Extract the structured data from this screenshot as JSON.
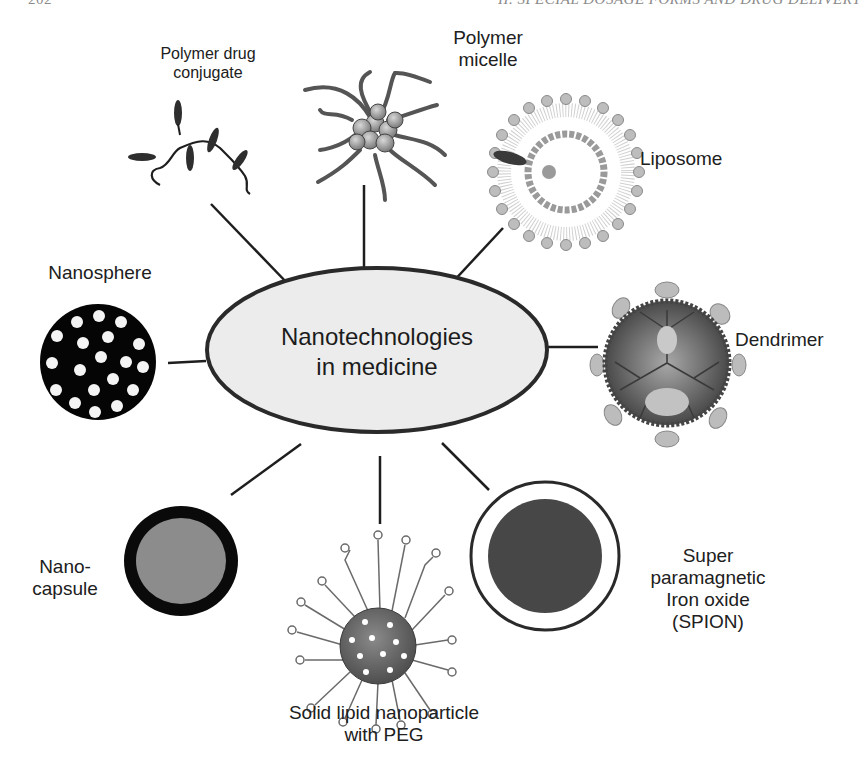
{
  "page": {
    "page_number": "202",
    "running_head": "II. SPECIAL DOSAGE FORMS AND DRUG DELIVERY"
  },
  "diagram": {
    "center": {
      "line1": "Nanotechnologies",
      "line2": "in medicine"
    },
    "nodes": [
      {
        "id": "polymer-drug-conjugate",
        "line1": "Polymer drug",
        "line2": "conjugate",
        "icon": "polymer-drug-conjugate-icon"
      },
      {
        "id": "polymer-micelle",
        "line1": "Polymer",
        "line2": "micelle",
        "icon": "polymer-micelle-icon"
      },
      {
        "id": "liposome",
        "line1": "Liposome",
        "icon": "liposome-icon"
      },
      {
        "id": "dendrimer",
        "line1": "Dendrimer",
        "icon": "dendrimer-icon"
      },
      {
        "id": "spion",
        "line1": "Super",
        "line2": "paramagnetic",
        "line3": "Iron oxide",
        "line4": "(SPION)",
        "icon": "spion-icon"
      },
      {
        "id": "solid-lipid-nanoparticle",
        "line1": "Solid lipid nanoparticle",
        "line2": "with PEG",
        "icon": "solid-lipid-nanoparticle-icon"
      },
      {
        "id": "nanocapsule",
        "line1": "Nano-",
        "line2": "capsule",
        "icon": "nanocapsule-icon"
      },
      {
        "id": "nanosphere",
        "line1": "Nanosphere",
        "icon": "nanosphere-icon"
      }
    ],
    "colors": {
      "ellipse_fill": "#ececec",
      "outline": "#2a2a2a",
      "nanosphere_fill": "#050505",
      "nanocapsule_core": "#8c8c8c",
      "spion_core": "#474747",
      "dendrimer_body": "#5e5e5e",
      "liposome_head": "#b9b9b9"
    }
  }
}
